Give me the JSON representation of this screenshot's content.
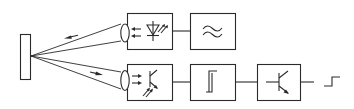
{
  "diagram": {
    "type": "block-diagram",
    "description": "Retro-reflective photoelectric sensor: emitter and receiver with lenses aimed at a reflector, followed by signal processing chain",
    "colors": {
      "stroke": "#2a2a2a",
      "background": "#ffffff"
    },
    "nodes": [
      {
        "id": "reflector",
        "label": "reflector",
        "symbol": "rectangle"
      },
      {
        "id": "emitter-lens",
        "label": "emitter lens",
        "symbol": "ellipse-lens"
      },
      {
        "id": "emitter",
        "label": "LED emitter",
        "symbol": "light-emitting-diode"
      },
      {
        "id": "oscillator",
        "label": "oscillator",
        "symbol": "double-tilde"
      },
      {
        "id": "receiver-lens",
        "label": "receiver lens",
        "symbol": "ellipse-lens"
      },
      {
        "id": "receiver",
        "label": "phototransistor receiver",
        "symbol": "phototransistor"
      },
      {
        "id": "schmitt-trigger",
        "label": "Schmitt trigger",
        "symbol": "hysteresis"
      },
      {
        "id": "output-stage",
        "label": "transistor output stage",
        "symbol": "transistor"
      },
      {
        "id": "output-signal",
        "label": "switching output",
        "symbol": "step-signal"
      }
    ],
    "edges": [
      {
        "from": "emitter",
        "to": "oscillator",
        "kind": "line"
      },
      {
        "from": "emitter-lens",
        "to": "reflector",
        "kind": "light-beam",
        "arrow": "toward-reflector"
      },
      {
        "from": "reflector",
        "to": "receiver-lens",
        "kind": "light-beam",
        "arrow": "toward-receiver"
      },
      {
        "from": "receiver",
        "to": "schmitt-trigger",
        "kind": "line"
      },
      {
        "from": "schmitt-trigger",
        "to": "output-stage",
        "kind": "line"
      },
      {
        "from": "output-stage",
        "to": "output-signal",
        "kind": "line"
      }
    ]
  }
}
